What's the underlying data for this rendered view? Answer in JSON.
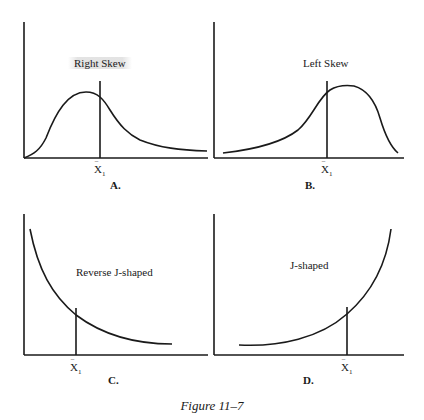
{
  "figure": {
    "caption": "Figure 11–7",
    "mean_symbol": "X",
    "mean_subscript": "1",
    "mean_bar": "‾"
  },
  "panels": [
    {
      "id": "A",
      "label": "A.",
      "title": "Right Skew",
      "shape": "right-skewed"
    },
    {
      "id": "B",
      "label": "B.",
      "title": "Left Skew",
      "shape": "left-skewed"
    },
    {
      "id": "C",
      "label": "C.",
      "title": "Reverse J-shaped",
      "shape": "reverse-j"
    },
    {
      "id": "D",
      "label": "D.",
      "title": "J-shaped",
      "shape": "j"
    }
  ],
  "colors": {
    "ink": "#1a1a1a",
    "background": "#ffffff"
  }
}
